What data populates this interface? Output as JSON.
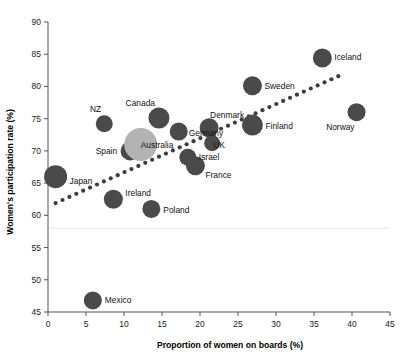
{
  "chart_data": {
    "type": "scatter",
    "title": "",
    "xlabel": "Proportion of women on boards (%)",
    "ylabel": "Women's participation rate (%)",
    "xlim": [
      0,
      45
    ],
    "ylim": [
      45,
      90
    ],
    "xticks": [
      0,
      5,
      10,
      15,
      20,
      25,
      30,
      35,
      40,
      45
    ],
    "yticks": [
      45,
      50,
      55,
      60,
      65,
      70,
      75,
      80,
      85,
      90
    ],
    "grid": "single faint horizontal gridline near 58",
    "legend": "none",
    "marker_style": "bubble (size varies by country)",
    "points": [
      {
        "label": "Japan",
        "x": 1.0,
        "y": 66.0,
        "r": 11.5,
        "color": "#4a4a4a",
        "label_dx": 14,
        "label_dy": 7
      },
      {
        "label": "NZ",
        "x": 7.4,
        "y": 74.2,
        "r": 8.5,
        "color": "#4a4a4a",
        "label_dx": -3,
        "label_dy": -12
      },
      {
        "label": "Spain",
        "x": 10.8,
        "y": 70.0,
        "r": 9.5,
        "color": "#4a4a4a",
        "label_dx": -13,
        "label_dy": 3
      },
      {
        "label": "Australia",
        "x": 12.2,
        "y": 71.0,
        "r": 16.5,
        "color": "#b3b3b3",
        "label_dx": 0,
        "label_dy": 4
      },
      {
        "label": "Canada",
        "x": 14.6,
        "y": 75.1,
        "r": 10.5,
        "color": "#4a4a4a",
        "label_dx": -4,
        "label_dy": -12
      },
      {
        "label": "Germany",
        "x": 17.2,
        "y": 73.0,
        "r": 9.0,
        "color": "#4a4a4a",
        "label_dx": 10,
        "label_dy": 4
      },
      {
        "label": "Israel",
        "x": 18.4,
        "y": 69.0,
        "r": 8.5,
        "color": "#4a4a4a",
        "label_dx": 11,
        "label_dy": 3
      },
      {
        "label": "France",
        "x": 19.4,
        "y": 67.7,
        "r": 9.5,
        "color": "#4a4a4a",
        "label_dx": 10,
        "label_dy": 12
      },
      {
        "label": "Denmark",
        "x": 21.2,
        "y": 73.6,
        "r": 9.5,
        "color": "#4a4a4a",
        "label_dx": 1,
        "label_dy": -10
      },
      {
        "label": "UK",
        "x": 21.6,
        "y": 71.2,
        "r": 8.0,
        "color": "#4a4a4a",
        "label_dx": 1,
        "label_dy": 5
      },
      {
        "label": "Ireland",
        "x": 8.6,
        "y": 62.5,
        "r": 9.5,
        "color": "#4a4a4a",
        "label_dx": 12,
        "label_dy": -3
      },
      {
        "label": "Poland",
        "x": 13.6,
        "y": 61.0,
        "r": 9.0,
        "color": "#4a4a4a",
        "label_dx": 12,
        "label_dy": 4
      },
      {
        "label": "Mexico",
        "x": 5.9,
        "y": 46.8,
        "r": 9.0,
        "color": "#4a4a4a",
        "label_dx": 12,
        "label_dy": 3
      },
      {
        "label": "Finland",
        "x": 26.9,
        "y": 74.0,
        "r": 10.5,
        "color": "#4a4a4a",
        "label_dx": 13,
        "label_dy": 4
      },
      {
        "label": "Sweden",
        "x": 26.9,
        "y": 80.1,
        "r": 9.5,
        "color": "#4a4a4a",
        "label_dx": 12,
        "label_dy": 3
      },
      {
        "label": "Iceland",
        "x": 36.1,
        "y": 84.4,
        "r": 9.5,
        "color": "#4a4a4a",
        "label_dx": 12,
        "label_dy": 2
      },
      {
        "label": "Norway",
        "x": 40.6,
        "y": 76.0,
        "r": 9.0,
        "color": "#4a4a4a",
        "label_dx": -2,
        "label_dy": 18
      }
    ],
    "trendline": {
      "style": "dotted",
      "color": "#3d3d3d",
      "x_start": 1.0,
      "y_start": 61.9,
      "x_end": 38.2,
      "y_end": 81.6
    }
  },
  "colors": {
    "bubble": "#4a4a4a",
    "highlight_bubble": "#b3b3b3",
    "axis": "#555555",
    "text": "#111111",
    "gridline": "#e8e8e8",
    "background": "#ffffff"
  }
}
